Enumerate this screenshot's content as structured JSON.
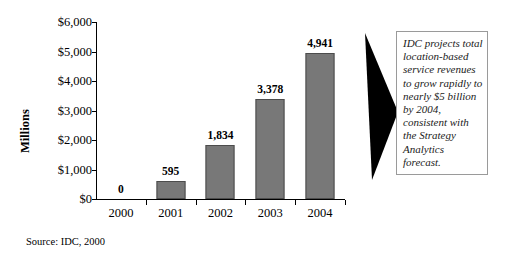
{
  "chart_data": {
    "type": "bar",
    "title": "",
    "subtitle": "",
    "xlabel": "",
    "ylabel": "Millions",
    "categories": [
      "2000",
      "2001",
      "2002",
      "2003",
      "2004"
    ],
    "values": [
      0,
      595,
      1834,
      3378,
      4941
    ],
    "value_labels": [
      "0",
      "595",
      "1,834",
      "3,378",
      "4,941"
    ],
    "ylim": [
      0,
      6000
    ],
    "ytick_values": [
      6000,
      5000,
      4000,
      3000,
      2000,
      1000,
      0
    ],
    "ytick_labels": [
      "$6,000",
      "$5,000",
      "$4,000",
      "$3,000",
      "$2,000",
      "$1,000",
      "$0"
    ],
    "grid": false,
    "legend": null,
    "legend_position": "none",
    "bar_color": "#787878",
    "bar_border_color": "#4c4c4c",
    "axis_color": "#000000",
    "annotations": [
      {
        "name": "callout",
        "text": "IDC projects total location-based service revenues to grow rapidly to nearly $5 billion by 2004, consistent with the Strategy Analytics forecast."
      },
      {
        "name": "source",
        "text": "Source: IDC, 2000"
      }
    ]
  },
  "axis": {
    "y_title": "Millions"
  },
  "source": {
    "text": "Source: IDC, 2000"
  },
  "callout": {
    "text": "IDC projects total location-based service revenues to grow rapidly to nearly $5 billion by 2004, consistent with the Strategy Analytics forecast.",
    "border_color": "#9a9a9a"
  },
  "arrow": {
    "color": "#000000",
    "direction": "right"
  }
}
